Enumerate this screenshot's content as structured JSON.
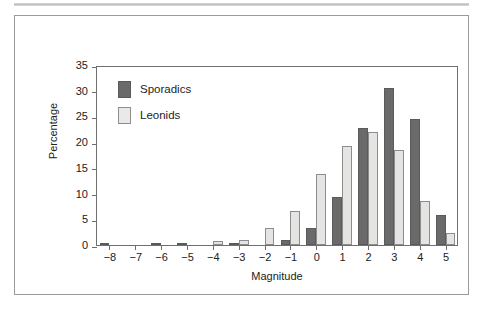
{
  "chart_data": {
    "type": "bar",
    "title": "",
    "xlabel": "Magnitude",
    "ylabel": "Percentage",
    "categories": [
      "-8",
      "-7",
      "-6",
      "-5",
      "-4",
      "-3",
      "-2",
      "-1",
      "0",
      "1",
      "2",
      "3",
      "4",
      "5"
    ],
    "series": [
      {
        "name": "Sporadics",
        "color": "#6a6a6a",
        "values": [
          0.2,
          0.0,
          0.3,
          0.2,
          0.0,
          0.3,
          0.0,
          1.0,
          3.4,
          9.4,
          22.8,
          30.5,
          24.5,
          5.9
        ]
      },
      {
        "name": "Leonids",
        "color": "#e4e4e2",
        "values": [
          0.0,
          0.0,
          0.0,
          0.0,
          0.7,
          1.0,
          3.4,
          6.6,
          13.9,
          19.2,
          21.9,
          18.4,
          8.5,
          2.3
        ]
      }
    ],
    "ylim": [
      0,
      35
    ],
    "yticks": [
      "0",
      "5",
      "10",
      "15",
      "20",
      "25",
      "30",
      "35"
    ],
    "ytick_values": [
      0,
      5,
      10,
      15,
      20,
      25,
      30,
      35
    ],
    "xlim": [
      -8,
      5
    ],
    "grid": false,
    "legend_position": "top-left",
    "legend": [
      "Sporadics",
      "Leonids"
    ]
  },
  "legend": {
    "items": [
      {
        "label": "Sporadics",
        "swatch": "dark-swatch"
      },
      {
        "label": "Leonids",
        "swatch": "light-swatch"
      }
    ]
  },
  "axes": {
    "y_title": "Percentage",
    "x_title": "Magnitude"
  }
}
